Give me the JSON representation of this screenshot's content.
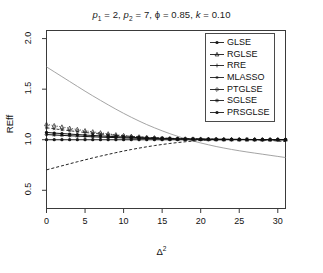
{
  "chart_data": {
    "type": "line",
    "title_parts": {
      "p1_label": "p",
      "p1_sub": "1",
      "p1_value": "2",
      "p2_label": "p",
      "p2_sub": "2",
      "p2_value": "7",
      "phi_label": "ϕ",
      "phi_value": "0.85",
      "k_label": "k",
      "k_value": "0.10"
    },
    "xlabel": "Δ",
    "xlabel_sup": "2",
    "ylabel": "REff",
    "xlim": [
      0,
      31
    ],
    "ylim": [
      0.32,
      2.08
    ],
    "xticks": [
      0,
      5,
      10,
      15,
      20,
      25,
      30
    ],
    "yticks": [
      0.5,
      1.0,
      1.5,
      2.0
    ],
    "xtick_labels": [
      "0",
      "5",
      "10",
      "15",
      "20",
      "25",
      "30"
    ],
    "ytick_labels": [
      "0.5",
      "1.0",
      "1.5",
      "2.0"
    ],
    "grid": false,
    "legend_position": "top-right",
    "x": [
      0,
      1,
      2,
      3,
      4,
      5,
      6,
      7,
      8,
      9,
      10,
      11,
      12,
      13,
      14,
      15,
      16,
      17,
      18,
      19,
      20,
      21,
      22,
      23,
      24,
      25,
      26,
      27,
      28,
      29,
      30,
      31
    ],
    "series": [
      {
        "name": "GLSE",
        "marker": "filled-circle",
        "dash": "solid",
        "color": "#1a1a1a",
        "width": 1.1,
        "values": [
          1.0,
          1.0,
          1.0,
          1.0,
          1.0,
          1.0,
          1.0,
          1.0,
          1.0,
          1.0,
          1.0,
          1.0,
          1.0,
          1.0,
          1.0,
          1.0,
          1.0,
          1.0,
          1.0,
          1.0,
          1.0,
          1.0,
          1.0,
          1.0,
          1.0,
          1.0,
          1.0,
          1.0,
          1.0,
          1.0,
          1.0,
          1.0
        ]
      },
      {
        "name": "RGLSE",
        "marker": "triangle",
        "dash": "dotted",
        "color": "#2b2b2b",
        "width": 0.9,
        "values": [
          1.152,
          1.139,
          1.126,
          1.113,
          1.101,
          1.089,
          1.078,
          1.068,
          1.058,
          1.049,
          1.041,
          1.034,
          1.028,
          1.023,
          1.019,
          1.015,
          1.012,
          1.01,
          1.008,
          1.007,
          1.006,
          1.005,
          1.004,
          1.003,
          1.003,
          1.002,
          1.002,
          1.002,
          1.001,
          1.001,
          1.001,
          1.001
        ]
      },
      {
        "name": "RRE",
        "marker": "plus",
        "dash": "solid",
        "color": "#9a9a9a",
        "width": 0.9,
        "values": [
          1.72,
          1.672,
          1.624,
          1.576,
          1.528,
          1.48,
          1.434,
          1.389,
          1.345,
          1.302,
          1.261,
          1.222,
          1.185,
          1.15,
          1.118,
          1.088,
          1.06,
          1.034,
          1.01,
          0.988,
          0.968,
          0.95,
          0.933,
          0.918,
          0.904,
          0.891,
          0.879,
          0.868,
          0.857,
          0.846,
          0.835,
          0.824
        ]
      },
      {
        "name": "MLASSO",
        "marker": "asterisk",
        "dash": "dashed",
        "color": "#232323",
        "width": 0.9,
        "values": [
          1.118,
          1.108,
          1.098,
          1.089,
          1.08,
          1.072,
          1.064,
          1.057,
          1.05,
          1.044,
          1.038,
          1.033,
          1.028,
          1.024,
          1.02,
          1.017,
          1.014,
          1.012,
          1.01,
          1.008,
          1.007,
          1.006,
          1.005,
          1.004,
          1.003,
          1.003,
          1.002,
          1.002,
          1.002,
          1.001,
          1.001,
          1.001
        ]
      },
      {
        "name": "PTGLSE",
        "marker": "diamond",
        "dash": "dashed",
        "color": "#222222",
        "width": 1.0,
        "values": [
          0.702,
          0.722,
          0.742,
          0.762,
          0.782,
          0.801,
          0.82,
          0.838,
          0.855,
          0.872,
          0.888,
          0.903,
          0.917,
          0.93,
          0.942,
          0.953,
          0.963,
          0.972,
          0.98,
          0.987,
          0.993,
          0.997,
          1.0,
          1.002,
          1.003,
          1.003,
          1.002,
          1.0,
          0.997,
          0.993,
          0.988,
          0.982
        ]
      },
      {
        "name": "SGLSE",
        "marker": "star",
        "dash": "solid",
        "color": "#111111",
        "width": 1.0,
        "values": [
          1.051,
          1.047,
          1.043,
          1.039,
          1.036,
          1.032,
          1.029,
          1.026,
          1.023,
          1.021,
          1.018,
          1.016,
          1.014,
          1.012,
          1.011,
          1.009,
          1.008,
          1.007,
          1.006,
          1.005,
          1.004,
          1.004,
          1.003,
          1.003,
          1.002,
          1.002,
          1.002,
          1.001,
          1.001,
          1.001,
          1.001,
          1.001
        ]
      },
      {
        "name": "PRSGLSE",
        "marker": "filled-circle",
        "dash": "solid",
        "color": "#111111",
        "width": 1.0,
        "values": [
          1.072,
          1.066,
          1.061,
          1.056,
          1.051,
          1.046,
          1.042,
          1.038,
          1.034,
          1.03,
          1.027,
          1.024,
          1.021,
          1.018,
          1.016,
          1.014,
          1.012,
          1.01,
          1.009,
          1.008,
          1.007,
          1.006,
          1.005,
          1.004,
          1.004,
          1.003,
          1.003,
          1.002,
          1.002,
          1.002,
          1.001,
          1.001
        ]
      }
    ]
  },
  "legend": {
    "items": [
      {
        "label": "GLSE",
        "marker": "filled-circle"
      },
      {
        "label": "RGLSE",
        "marker": "triangle"
      },
      {
        "label": "RRE",
        "marker": "plus"
      },
      {
        "label": "MLASSO",
        "marker": "asterisk"
      },
      {
        "label": "PTGLSE",
        "marker": "diamond"
      },
      {
        "label": "SGLSE",
        "marker": "star"
      },
      {
        "label": "PRSGLSE",
        "marker": "filled-circle"
      }
    ]
  }
}
